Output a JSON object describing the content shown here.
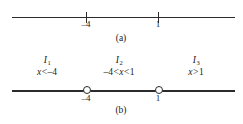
{
  "figure": {
    "panels": [
      {
        "id": "a",
        "caption": "(a)",
        "axis": {
          "x_start_px": 12,
          "x_end_px": 235,
          "y_px": 17
        },
        "points": [
          {
            "label": "–4",
            "value": -4,
            "x_px": 86,
            "marker": "tick"
          },
          {
            "label": "1",
            "value": 1,
            "x_px": 158,
            "marker": "tick"
          }
        ]
      },
      {
        "id": "b",
        "caption": "(b)",
        "axis": {
          "x_start_px": 12,
          "x_end_px": 235,
          "y_px": 91
        },
        "points": [
          {
            "label": "–4",
            "value": -4,
            "x_px": 86,
            "marker": "open-circle"
          },
          {
            "label": "1",
            "value": 1,
            "x_px": 158,
            "marker": "open-circle"
          }
        ],
        "intervals": [
          {
            "name": "I",
            "subscript": "1",
            "inequality_parts": {
              "left_num": "",
              "left_op": "",
              "var": "x",
              "right_op": "<",
              "right_num": "–4"
            },
            "inequality": "x < –4",
            "center_x_px": 47
          },
          {
            "name": "I",
            "subscript": "2",
            "inequality_parts": {
              "left_num": "–4",
              "left_op": "<",
              "var": "x",
              "right_op": "<",
              "right_num": "1"
            },
            "inequality": "–4 < x < 1",
            "center_x_px": 119
          },
          {
            "name": "I",
            "subscript": "3",
            "inequality_parts": {
              "left_num": "",
              "left_op": "",
              "var": "x",
              "right_op": ">",
              "right_num": "1"
            },
            "inequality": "x > 1",
            "center_x_px": 196
          }
        ]
      }
    ],
    "colors": {
      "ink": "#2b2b2b",
      "background": "#ffffff"
    }
  }
}
